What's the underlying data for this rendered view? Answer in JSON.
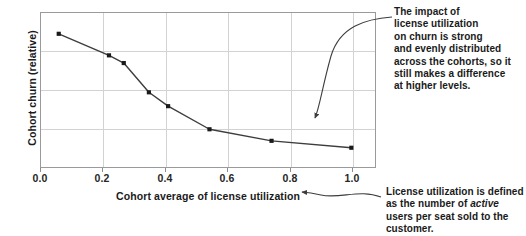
{
  "chart_data": {
    "type": "line",
    "title": "",
    "xlabel": "Cohort average of license utilization",
    "ylabel": "Cohort churn (relative)",
    "xlim": [
      -0.03,
      1.1
    ],
    "ylim": [
      0,
      1
    ],
    "xticks": [
      "0.0",
      "0.2",
      "0.4",
      "0.6",
      "0.8",
      "1.0"
    ],
    "xtick_values": [
      0.0,
      0.2,
      0.4,
      0.6,
      0.8,
      1.0
    ],
    "yticks": [],
    "grid": "both",
    "legend": "none",
    "marker": "square",
    "x": [
      0.03,
      0.2,
      0.25,
      0.335,
      0.4,
      0.54,
      0.75,
      1.02
    ],
    "y": [
      0.865,
      0.725,
      0.675,
      0.485,
      0.395,
      0.245,
      0.17,
      0.125
    ],
    "series": [
      {
        "name": "Cohort churn (relative)",
        "x": [
          0.03,
          0.2,
          0.25,
          0.335,
          0.4,
          0.54,
          0.75,
          1.02
        ],
        "values": [
          0.865,
          0.725,
          0.675,
          0.485,
          0.395,
          0.245,
          0.17,
          0.125
        ]
      }
    ]
  },
  "annotations": {
    "top_note": "The impact of license utilization on churn is strong and evenly distributed across the cohorts, so it still makes a difference at higher levels.",
    "top_note_lines": [
      "The impact of",
      "license utilization",
      "on churn is strong",
      "and evenly distributed",
      "across the cohorts, so it",
      "still makes a difference",
      "at higher levels."
    ],
    "bottom_note_prefix": "License utilization is defined as the number of ",
    "bottom_note_emphasis": "active",
    "bottom_note_suffix": " users per seat sold to the customer.",
    "bottom_note": "License utilization is defined as the number of active users per seat sold to the customer."
  },
  "style": {
    "line_color": "#3d3d3d",
    "marker_color": "#1a1a1a",
    "grid_color": "#d2d2d2",
    "frame_color": "#9a9a9a",
    "text_color": "#1a1a1a",
    "background": "#ffffff"
  }
}
